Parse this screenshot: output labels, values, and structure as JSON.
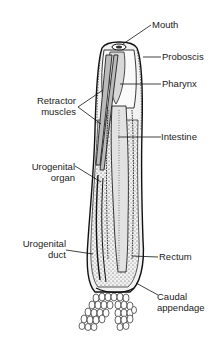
{
  "figure": {
    "labels": {
      "mouth": "Mouth",
      "proboscis": "Proboscis",
      "pharynx": "Pharynx",
      "retractor_muscles_line1": "Retractor",
      "retractor_muscles_line2": "muscles",
      "intestine": "Intestine",
      "urogenital_organ_line1": "Urogenital",
      "urogenital_organ_line2": "organ",
      "urogenital_duct_line1": "Urogenital",
      "urogenital_duct_line2": "duct",
      "rectum": "Rectum",
      "caudal_appendage_line1": "Caudal",
      "caudal_appendage_line2": "appendage"
    }
  }
}
